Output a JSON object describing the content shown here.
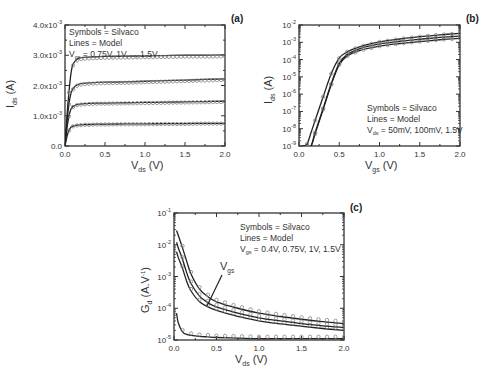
{
  "chart_data": [
    {
      "id": "a",
      "type": "line",
      "panel_label": "(a)",
      "xlabel": "V_ds (V)",
      "xlabel_main": "V",
      "xlabel_sub": "ds",
      "xlabel_unit": " (V)",
      "ylabel": "I_ds (A)",
      "ylabel_main": "I",
      "ylabel_sub": "ds",
      "ylabel_unit": " (A)",
      "xlim": [
        0,
        2.0
      ],
      "ylim": [
        0,
        0.004
      ],
      "yscale": "linear",
      "x_ticks": [
        "0.0",
        "0.5",
        "1.0",
        "1.5",
        "2.0"
      ],
      "y_ticks": [
        {
          "mant": "0.0",
          "exp": ""
        },
        {
          "mant": "1.0x10",
          "exp": "-3"
        },
        {
          "mant": "2.0x10",
          "exp": "-3"
        },
        {
          "mant": "3.0x10",
          "exp": "-3"
        },
        {
          "mant": "4.0x10",
          "exp": "-3"
        }
      ],
      "legend": {
        "position": "upper-left",
        "line1": "Symbols = Silvaco",
        "line2": "Lines = Model",
        "line3_main": "V",
        "line3_sub": "gs",
        "line3_rest": " = 0.75V, 1V,..., 1.5V"
      },
      "grid": false,
      "x": [
        0,
        0.025,
        0.05,
        0.075,
        0.1,
        0.15,
        0.2,
        0.25,
        0.3,
        0.4,
        0.5,
        0.75,
        1.0,
        1.25,
        1.5,
        1.75,
        2.0
      ],
      "series": [
        {
          "name": "Vgs=0.75V",
          "values": [
            0,
            0.00032,
            0.00052,
            0.00062,
            0.00066,
            0.00069,
            0.0007,
            0.00071,
            0.00071,
            0.00072,
            0.00072,
            0.00073,
            0.00073,
            0.00074,
            0.00074,
            0.00075,
            0.00075
          ]
        },
        {
          "name": "Vgs=1V",
          "values": [
            0,
            0.0006,
            0.001,
            0.00122,
            0.00131,
            0.00137,
            0.00139,
            0.0014,
            0.00141,
            0.00142,
            0.00142,
            0.00143,
            0.00144,
            0.00145,
            0.00146,
            0.00147,
            0.00148
          ]
        },
        {
          "name": "Vgs=1.25V",
          "values": [
            0,
            0.0008,
            0.0014,
            0.00175,
            0.0019,
            0.00202,
            0.00206,
            0.00208,
            0.00209,
            0.0021,
            0.00211,
            0.00212,
            0.00214,
            0.00216,
            0.00218,
            0.0022,
            0.00222
          ]
        },
        {
          "name": "Vgs=1.5V",
          "values": [
            0,
            0.001,
            0.0018,
            0.0024,
            0.0027,
            0.00287,
            0.00292,
            0.00293,
            0.00294,
            0.00295,
            0.00296,
            0.00297,
            0.00298,
            0.00299,
            0.003,
            0.003,
            0.00301
          ]
        }
      ]
    },
    {
      "id": "b",
      "type": "line",
      "panel_label": "(b)",
      "xlabel": "V_gs (V)",
      "xlabel_main": "V",
      "xlabel_sub": "gs",
      "xlabel_unit": " (V)",
      "ylabel": "I_ds (A)",
      "ylabel_main": "I",
      "ylabel_sub": "ds",
      "ylabel_unit": " (A)",
      "xlim": [
        0,
        2.0
      ],
      "ylim": [
        1e-09,
        0.01
      ],
      "yscale": "log",
      "x_ticks": [
        "0.0",
        "0.5",
        "1.0",
        "1.5",
        "2.0"
      ],
      "y_ticks": [
        {
          "mant": "10",
          "exp": "-9"
        },
        {
          "mant": "10",
          "exp": "-8"
        },
        {
          "mant": "10",
          "exp": "-7"
        },
        {
          "mant": "10",
          "exp": "-6"
        },
        {
          "mant": "10",
          "exp": "-5"
        },
        {
          "mant": "10",
          "exp": "-4"
        },
        {
          "mant": "10",
          "exp": "-3"
        },
        {
          "mant": "10",
          "exp": "-2"
        }
      ],
      "legend": {
        "position": "lower-right",
        "line1": "Symbols = Silvaco",
        "line2": "Lines = Model",
        "line3_main": "V",
        "line3_sub": "ds",
        "line3_rest": " = 50mV, 100mV, 1.5V"
      },
      "grid": false,
      "x": [
        0.05,
        0.1,
        0.15,
        0.2,
        0.3,
        0.4,
        0.5,
        0.6,
        0.75,
        1.0,
        1.25,
        1.5,
        1.75,
        2.0
      ],
      "series": [
        {
          "name": "Vds=50mV",
          "values": [
            1e-09,
            1e-09,
            1e-09,
            5e-09,
            1.3e-07,
            3.5e-06,
            5e-05,
            0.00016,
            0.00033,
            0.0006,
            0.00085,
            0.0011,
            0.0014,
            0.0017
          ]
        },
        {
          "name": "Vds=100mV",
          "values": [
            1e-09,
            1e-09,
            1e-09,
            6e-09,
            1.5e-07,
            4e-06,
            6e-05,
            0.0002,
            0.00042,
            0.0008,
            0.00115,
            0.0015,
            0.0019,
            0.0023
          ]
        },
        {
          "name": "Vds=1.5V",
          "values": [
            1e-09,
            1.3e-09,
            6e-09,
            3e-08,
            7e-07,
            1.5e-05,
            0.00012,
            0.00028,
            0.00055,
            0.00105,
            0.00155,
            0.0021,
            0.0027,
            0.0033
          ]
        }
      ]
    },
    {
      "id": "c",
      "type": "line",
      "panel_label": "(c)",
      "xlabel": "V_ds (V)",
      "xlabel_main": "V",
      "xlabel_sub": "ds",
      "xlabel_unit": " (V)",
      "ylabel": "G_d (A.V^-1)",
      "ylabel_main": "G",
      "ylabel_sub": "d",
      "ylabel_unit": " (A.V",
      "ylabel_sup": "-1",
      "ylabel_close": ")",
      "xlim": [
        0,
        2.0
      ],
      "ylim": [
        1e-05,
        0.1
      ],
      "yscale": "log",
      "x_ticks": [
        "0.0",
        "0.5",
        "1.0",
        "1.5",
        "2.0"
      ],
      "y_ticks": [
        {
          "mant": "10",
          "exp": "-5"
        },
        {
          "mant": "10",
          "exp": "-4"
        },
        {
          "mant": "10",
          "exp": "-3"
        },
        {
          "mant": "10",
          "exp": "-2"
        },
        {
          "mant": "10",
          "exp": "-1"
        }
      ],
      "legend": {
        "position": "upper-right",
        "line1": "Symbols = Silvaco",
        "line2": "Lines = Model",
        "line3_main": "V",
        "line3_sub": "gs",
        "line3_rest": " = 0.4V, 0.75V, 1V, 1.5V"
      },
      "annotation": {
        "main": "V",
        "sub": "gs",
        "arrow_direction": "increasing Vgs upward"
      },
      "grid": false,
      "x": [
        0.03,
        0.05,
        0.1,
        0.15,
        0.2,
        0.3,
        0.4,
        0.5,
        0.75,
        1.0,
        1.25,
        1.5,
        1.75,
        2.0
      ],
      "series": [
        {
          "name": "Vgs=0.4V",
          "values": [
            7e-05,
            3.5e-05,
            1.8e-05,
            1.5e-05,
            1.4e-05,
            1.3e-05,
            1.25e-05,
            1.2e-05,
            1.15e-05,
            1.1e-05,
            1.1e-05,
            1.1e-05,
            1.1e-05,
            1.1e-05
          ]
        },
        {
          "name": "Vgs=0.75V",
          "values": [
            0.006,
            0.004,
            0.0018,
            0.0007,
            0.00035,
            0.00016,
            0.00011,
            8.5e-05,
            5.5e-05,
            4e-05,
            3.2e-05,
            2.7e-05,
            2.3e-05,
            2e-05
          ]
        },
        {
          "name": "Vgs=1V",
          "values": [
            0.012,
            0.008,
            0.0035,
            0.0013,
            0.0006,
            0.00024,
            0.00015,
            0.00011,
            7e-05,
            5e-05,
            4e-05,
            3.3e-05,
            2.8e-05,
            2.5e-05
          ]
        },
        {
          "name": "Vgs=1.5V",
          "values": [
            0.028,
            0.02,
            0.008,
            0.003,
            0.0012,
            0.0004,
            0.00023,
            0.00016,
            0.0001,
            7e-05,
            5.5e-05,
            4.5e-05,
            3.8e-05,
            3.3e-05
          ]
        }
      ]
    }
  ]
}
